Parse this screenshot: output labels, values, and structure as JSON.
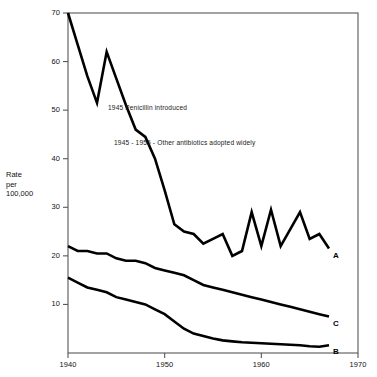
{
  "chart_data": {
    "type": "line",
    "title": "",
    "xlabel": "",
    "ylabel": "Rate per 100,000",
    "ylabel_lines": [
      "Rate",
      "per",
      "100,000"
    ],
    "xlim": [
      1940,
      1970
    ],
    "ylim": [
      0,
      70
    ],
    "grid": false,
    "legend": "inline-end-labels",
    "xticks": [
      1940,
      1950,
      1960,
      1970
    ],
    "xtick_labels": [
      "1940",
      "1950",
      "1960",
      "1970"
    ],
    "yticks": [
      10,
      20,
      30,
      40,
      50,
      60,
      70
    ],
    "ytick_labels": [
      "10",
      "20",
      "30",
      "40",
      "50",
      "60",
      "70"
    ],
    "line_color": "#000000",
    "series": [
      {
        "name": "A",
        "label": "A",
        "x": [
          1940,
          1941,
          1942,
          1943,
          1944,
          1945,
          1946,
          1947,
          1948,
          1949,
          1950,
          1951,
          1952,
          1953,
          1954,
          1955,
          1956,
          1957,
          1958,
          1959,
          1960,
          1961,
          1962,
          1963,
          1964,
          1965,
          1966,
          1967
        ],
        "values": [
          70.0,
          63.5,
          57.0,
          51.5,
          62.0,
          56.5,
          51.0,
          46.0,
          44.5,
          40.0,
          33.5,
          26.5,
          25.0,
          24.5,
          22.5,
          23.5,
          24.5,
          20.0,
          21.0,
          29.0,
          22.0,
          29.5,
          22.0,
          25.5,
          29.0,
          23.5,
          24.5,
          21.5
        ]
      },
      {
        "name": "C",
        "label": "C",
        "x": [
          1940,
          1941,
          1942,
          1943,
          1944,
          1945,
          1946,
          1947,
          1948,
          1949,
          1950,
          1951,
          1952,
          1953,
          1954,
          1955,
          1956,
          1957,
          1958,
          1959,
          1960,
          1961,
          1962,
          1963,
          1964,
          1965,
          1966,
          1967
        ],
        "values": [
          22.0,
          21.0,
          21.0,
          20.5,
          20.5,
          19.5,
          19.0,
          19.0,
          18.5,
          17.5,
          17.0,
          16.5,
          16.0,
          15.0,
          14.0,
          13.5,
          13.0,
          12.5,
          12.0,
          11.5,
          11.0,
          10.5,
          10.0,
          9.5,
          9.0,
          8.5,
          8.0,
          7.5
        ]
      },
      {
        "name": "B",
        "label": "B",
        "x": [
          1940,
          1941,
          1942,
          1943,
          1944,
          1945,
          1946,
          1947,
          1948,
          1949,
          1950,
          1951,
          1952,
          1953,
          1954,
          1955,
          1956,
          1957,
          1958,
          1959,
          1960,
          1961,
          1962,
          1963,
          1964,
          1965,
          1966,
          1967
        ],
        "values": [
          15.5,
          14.5,
          13.5,
          13.0,
          12.5,
          11.5,
          11.0,
          10.5,
          10.0,
          9.0,
          8.0,
          6.5,
          5.0,
          4.0,
          3.5,
          3.0,
          2.6,
          2.4,
          2.2,
          2.1,
          2.0,
          1.9,
          1.8,
          1.7,
          1.6,
          1.4,
          1.3,
          1.6
        ]
      }
    ],
    "annotations": [
      {
        "text": "1945 Penicillin introduced",
        "x_px": 108,
        "y_px": 104
      },
      {
        "text": "1945 - 1955 - Other antibiotics adopted widely",
        "x_px": 114,
        "y_px": 139
      }
    ]
  }
}
